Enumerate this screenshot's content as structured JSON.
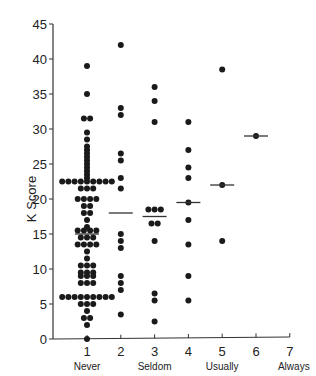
{
  "chart_data": {
    "type": "scatter",
    "title": "",
    "xlabel": "",
    "ylabel": "K Score",
    "xlim": [
      0.6,
      7
    ],
    "ylim": [
      0,
      45
    ],
    "x_ticks": [
      1,
      2,
      3,
      4,
      5,
      6,
      7
    ],
    "y_ticks": [
      0,
      5,
      10,
      15,
      20,
      25,
      30,
      35,
      40,
      45
    ],
    "category_labels": [
      {
        "x": 1,
        "label": "Never"
      },
      {
        "x": 3,
        "label": "Seldom"
      },
      {
        "x": 5,
        "label": "Usually"
      },
      {
        "x": 7,
        "label": "Always"
      }
    ],
    "grid": false,
    "legend": null,
    "groups": [
      {
        "x": 1,
        "median": 15,
        "values": [
          39,
          35,
          31.5,
          31.5,
          29.5,
          28.5,
          27.5,
          27,
          26.5,
          26,
          25.5,
          25,
          24.5,
          24,
          23.5,
          23,
          22.5,
          22.5,
          22.5,
          22.5,
          22.5,
          22.5,
          22.5,
          22.5,
          22.5,
          21.5,
          21.5,
          21.5,
          20,
          20,
          20,
          20,
          19,
          19,
          18,
          18,
          17,
          16,
          15.5,
          15.5,
          15.5,
          15.5,
          14.5,
          14.5,
          14.5,
          13.5,
          13.5,
          13.5,
          13.5,
          12.5,
          11.5,
          10.5,
          10.5,
          10.5,
          9.5,
          9.5,
          9.5,
          9,
          9,
          9,
          8,
          8,
          8,
          6,
          6,
          6,
          6,
          6,
          6,
          6,
          6,
          6,
          5,
          5,
          5,
          4,
          3,
          3,
          2,
          0
        ]
      },
      {
        "x": 2,
        "median": 18,
        "values": [
          42,
          33,
          32,
          26.5,
          25.5,
          23,
          21.5,
          15,
          14,
          13,
          9,
          8,
          7,
          3.5
        ]
      },
      {
        "x": 3,
        "median": 17.5,
        "values": [
          36,
          34,
          31,
          18.5,
          18.5,
          18.5,
          16.5,
          16.5,
          14,
          6.5,
          5.5,
          2.5
        ]
      },
      {
        "x": 4,
        "median": 19.5,
        "values": [
          31,
          27,
          24.5,
          23,
          19.5,
          17,
          13.5,
          9,
          5.5
        ]
      },
      {
        "x": 5,
        "median": 22,
        "values": [
          38.5,
          22,
          14
        ]
      },
      {
        "x": 6,
        "median": 29,
        "values": [
          29
        ]
      }
    ]
  }
}
